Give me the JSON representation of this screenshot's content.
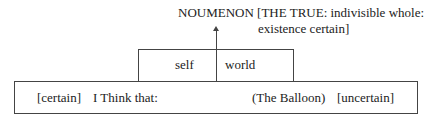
{
  "noumenon": {
    "line1": "NOUMENON [THE TRUE:  indivisible whole:",
    "line2": "existence certain]"
  },
  "upper_box": {
    "left": "self",
    "right": "world"
  },
  "lower_box": {
    "certain": "[certain]",
    "i_think": "I Think that:",
    "balloon": "(The Balloon)",
    "uncertain": "[uncertain]"
  }
}
